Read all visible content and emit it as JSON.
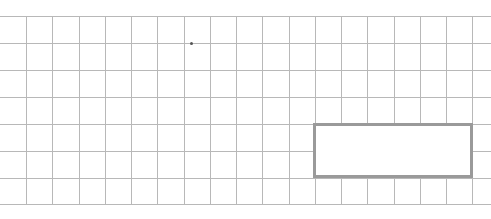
{
  "canvas": {
    "width": 491,
    "height": 219,
    "background": "#ffffff"
  },
  "grid": {
    "line_color": "#b8b8b8",
    "top": 16,
    "bottom": 204,
    "vertical_lines_x": [
      26,
      52,
      79,
      105,
      131,
      157,
      184,
      210,
      236,
      262,
      289,
      315,
      341,
      367,
      394,
      420,
      446,
      472
    ],
    "horizontal_lines_y": [
      16,
      43,
      70,
      97,
      124,
      151,
      178,
      204
    ]
  },
  "highlight_box": {
    "x": 313,
    "y": 123,
    "width": 160,
    "height": 55,
    "border_color": "#9a9a9a"
  },
  "dot": {
    "x": 190,
    "y": 42
  }
}
